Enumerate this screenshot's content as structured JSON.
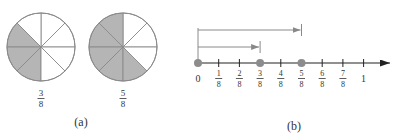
{
  "panel_a": {
    "caption": "(a)",
    "pies": [
      {
        "name": "pie-three-eighths",
        "cx": 41,
        "cy": 47,
        "r": 34,
        "slices": 8,
        "shaded": [
          3,
          4,
          5
        ],
        "numerator": "3",
        "denominator": "8"
      },
      {
        "name": "pie-five-eighths",
        "cx": 123,
        "cy": 47,
        "r": 34,
        "slices": 8,
        "shaded": [
          2,
          3,
          4,
          5,
          6
        ],
        "numerator": "5",
        "denominator": "8"
      }
    ]
  },
  "panel_b": {
    "caption": "(b)",
    "number_line": {
      "y": 63,
      "x0": 198,
      "step": 20.7,
      "end_x": 390,
      "ticks": [
        {
          "num": "0",
          "den": ""
        },
        {
          "num": "1",
          "den": "8"
        },
        {
          "num": "2",
          "den": "8"
        },
        {
          "num": "3",
          "den": "8"
        },
        {
          "num": "4",
          "den": "8"
        },
        {
          "num": "5",
          "den": "8"
        },
        {
          "num": "6",
          "den": "8"
        },
        {
          "num": "7",
          "den": "8"
        },
        {
          "num": "1",
          "den": ""
        }
      ],
      "dots": [
        0,
        3,
        5
      ],
      "arrows": [
        {
          "name": "arrow-three-eighths",
          "to_index": 3,
          "y": 47
        },
        {
          "name": "arrow-five-eighths",
          "to_index": 5,
          "y": 30
        }
      ]
    }
  },
  "colors": {
    "shade": "#b5b5b5",
    "line": "#8a8a8a",
    "axis": "#222222",
    "dot": "#8c8c8c",
    "text": "#333333"
  }
}
